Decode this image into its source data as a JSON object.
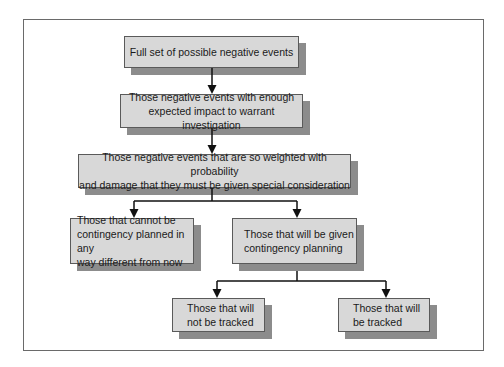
{
  "diagram": {
    "nodes": [
      {
        "id": "n1",
        "label": "Full set of possible negative events"
      },
      {
        "id": "n2",
        "label": "Those negative events with enough\nexpected impact to warrant  investigation"
      },
      {
        "id": "n3",
        "label": "Those negative events that are so weighted with probability\nand damage that they must be given special consideration"
      },
      {
        "id": "n4",
        "label": "Those that cannot be\ncontingency planned in any\nway different from now"
      },
      {
        "id": "n5",
        "label": "Those that will be given\ncontingency planning"
      },
      {
        "id": "n6",
        "label": "Those that will\nnot be tracked"
      },
      {
        "id": "n7",
        "label": "Those that will\nbe tracked"
      }
    ],
    "edges": [
      {
        "from": "n1",
        "to": "n2"
      },
      {
        "from": "n2",
        "to": "n3"
      },
      {
        "from": "n3",
        "to": "n4"
      },
      {
        "from": "n3",
        "to": "n5"
      },
      {
        "from": "n5",
        "to": "n6"
      },
      {
        "from": "n5",
        "to": "n7"
      }
    ],
    "colors": {
      "box_fill": "#d8d8d8",
      "box_border": "#5a5a5a",
      "shadow": "#8c8c8c",
      "connector": "#111111",
      "frame": "#6a6a6a"
    }
  }
}
